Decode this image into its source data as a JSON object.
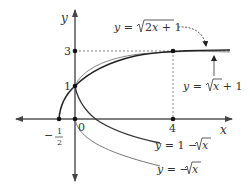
{
  "axes": {
    "x_label": "x",
    "y_label": "y",
    "origin_label": "0",
    "ticks": {
      "x_neg_half_num": "1",
      "x_neg_half_den": "2",
      "x_neg_sign": "−",
      "x_four": "4",
      "y_one": "1",
      "y_three": "3"
    }
  },
  "curves": {
    "sqrt_2x_plus_1": {
      "label": "y = √2x + 1",
      "y_part": "y = ",
      "radicand": "2x + 1",
      "color": "#222222"
    },
    "sqrt_x_plus_1": {
      "label": "y = √x + 1",
      "y_part": "y = ",
      "radicand": "x",
      "tail": " + 1",
      "color": "#888888"
    },
    "one_minus_sqrt_x": {
      "label": "y = 1 − √x",
      "y_part": "y = 1 − ",
      "radicand": "x",
      "color": "#333333"
    },
    "neg_sqrt_x": {
      "label": "y = −√x",
      "y_part": "y = −",
      "radicand": "x",
      "color": "#777777"
    }
  },
  "colors": {
    "axis": "#555555",
    "dotted": "#666666",
    "point": "#111111"
  }
}
